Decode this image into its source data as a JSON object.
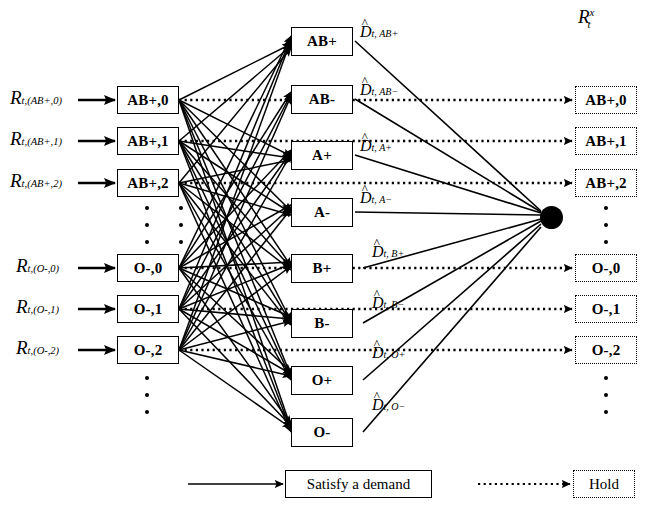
{
  "figure": {
    "title_right": {
      "base": "R",
      "sub": "t",
      "sup": "x"
    },
    "legend": {
      "satisfy_label": "Satisfy a demand",
      "hold_label": "Hold"
    }
  },
  "colors": {
    "ink": "#000000",
    "background": "#ffffff"
  },
  "left_column": {
    "name": "inventory-age-nodes",
    "nodes": [
      {
        "label": "AB+,0",
        "arrow_label": {
          "base": "R",
          "sub": "t,(AB+,0)"
        }
      },
      {
        "label": "AB+,1",
        "arrow_label": {
          "base": "R",
          "sub": "t,(AB+,1)"
        }
      },
      {
        "label": "AB+,2",
        "arrow_label": {
          "base": "R",
          "sub": "t,(AB+,2)"
        }
      },
      {
        "label": "O-,0",
        "arrow_label": {
          "base": "R",
          "sub": "t,(O-,0)"
        }
      },
      {
        "label": "O-,1",
        "arrow_label": {
          "base": "R",
          "sub": "t,(O-,1)"
        }
      },
      {
        "label": "O-,2",
        "arrow_label": {
          "base": "R",
          "sub": "t,(O-,2)"
        }
      }
    ],
    "ellipsis_count": 3
  },
  "middle_column": {
    "name": "demand-type-nodes",
    "nodes": [
      {
        "label": "AB+",
        "demand": {
          "base": "D",
          "sub": "t, AB+"
        }
      },
      {
        "label": "AB-",
        "demand": {
          "base": "D",
          "sub": "t, AB−"
        }
      },
      {
        "label": "A+",
        "demand": {
          "base": "D",
          "sub": "t, A+"
        }
      },
      {
        "label": "A-",
        "demand": {
          "base": "D",
          "sub": "t, A−"
        }
      },
      {
        "label": "B+",
        "demand": {
          "base": "D",
          "sub": "t, B+"
        }
      },
      {
        "label": "B-",
        "demand": {
          "base": "D",
          "sub": "t, B−"
        }
      },
      {
        "label": "O+",
        "demand": {
          "base": "D",
          "sub": "t, O+"
        }
      },
      {
        "label": "O-",
        "demand": {
          "base": "D",
          "sub": "t, O−"
        }
      }
    ],
    "hat_symbol": "^"
  },
  "right_column": {
    "name": "post-decision-nodes",
    "nodes": [
      {
        "label": "AB+,0"
      },
      {
        "label": "AB+,1"
      },
      {
        "label": "AB+,2"
      },
      {
        "label": "O-,0"
      },
      {
        "label": "O-,1"
      },
      {
        "label": "O-,2"
      }
    ],
    "ellipsis_count": 3
  }
}
